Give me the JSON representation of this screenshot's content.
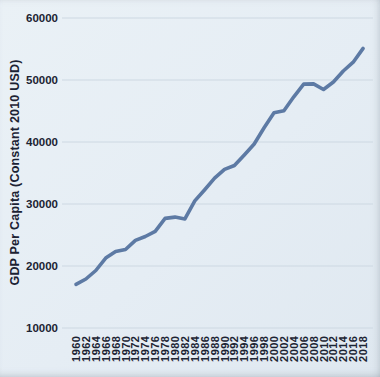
{
  "page": {
    "background": "#e5edf4",
    "text_color": "#1c2433"
  },
  "chart_data": {
    "type": "line",
    "title": "",
    "xlabel": "",
    "ylabel": "GDP Per Capita (Constant 2010 USD)",
    "x": [
      1960,
      1962,
      1964,
      1966,
      1968,
      1970,
      1972,
      1974,
      1976,
      1978,
      1980,
      1982,
      1984,
      1986,
      1988,
      1990,
      1992,
      1994,
      1996,
      1998,
      2000,
      2002,
      2004,
      2006,
      2008,
      2010,
      2012,
      2014,
      2016,
      2018
    ],
    "xtick_labels": [
      "1960",
      "1962",
      "1964",
      "1966",
      "1968",
      "1970",
      "1972",
      "1974",
      "1976",
      "1978",
      "1980",
      "1982",
      "1984",
      "1986",
      "1988",
      "1990",
      "1992",
      "1994",
      "1996",
      "1998",
      "2000",
      "2002",
      "2004",
      "2006",
      "2008",
      "2010",
      "2012",
      "2014",
      "2016",
      "2018"
    ],
    "series": [
      {
        "name": "GDP per capita",
        "values": [
          17037,
          17907,
          19271,
          21282,
          22331,
          22656,
          24122,
          24766,
          25601,
          27684,
          27885,
          27593,
          30501,
          32314,
          34163,
          35578,
          36206,
          37916,
          39678,
          42293,
          44727,
          45055,
          47288,
          49338,
          49364,
          48468,
          49674,
          51451,
          52873,
          55091
        ]
      }
    ],
    "ylim": [
      10000,
      60000
    ],
    "yticks": [
      10000,
      20000,
      30000,
      40000,
      50000,
      60000
    ],
    "ytick_labels": [
      "10000",
      "20000",
      "30000",
      "40000",
      "50000",
      "60000"
    ],
    "grid": true,
    "grid_axis": "horizontal",
    "legend": false,
    "line_color": "#5d7aa4",
    "grid_color": "#cdd8e2",
    "plot_bg": "#e5edf4"
  }
}
